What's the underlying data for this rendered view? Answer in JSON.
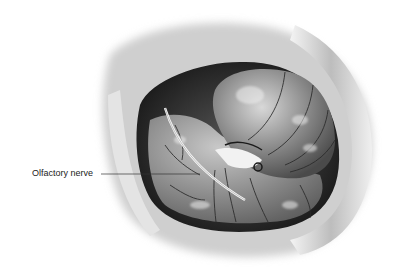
{
  "figure": {
    "labels": [
      {
        "text": "Olfactory nerve",
        "x": 32,
        "y": 168,
        "leader_to": [
          200,
          174
        ]
      }
    ]
  }
}
